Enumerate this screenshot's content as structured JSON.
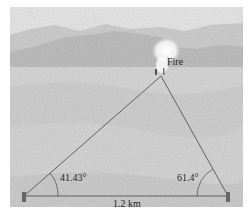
{
  "diagram": {
    "fire_label": "Fire",
    "left_angle": "41.43°",
    "right_angle": "61.4°",
    "base_distance": "1.2 km",
    "colors": {
      "sky": "#e6e6e6",
      "mountains": "#b9b9b9",
      "ground": "#d4d4d4",
      "lines": "#555555",
      "smoke": "#fbfbfb"
    }
  }
}
